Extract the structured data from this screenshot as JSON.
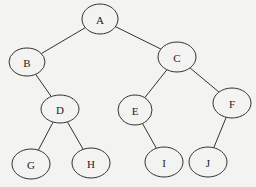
{
  "diagram": {
    "type": "binary-tree",
    "background": "#f3f3f1",
    "stroke_color": "#333333",
    "nodes": [
      {
        "id": "A",
        "label": "A",
        "cx": 100,
        "cy": 19,
        "rx": 18,
        "ry": 15
      },
      {
        "id": "B",
        "label": "B",
        "cx": 27,
        "cy": 62,
        "rx": 18,
        "ry": 14
      },
      {
        "id": "C",
        "label": "C",
        "cx": 177,
        "cy": 57,
        "rx": 19,
        "ry": 15
      },
      {
        "id": "D",
        "label": "D",
        "cx": 60,
        "cy": 109,
        "rx": 19,
        "ry": 14
      },
      {
        "id": "E",
        "label": "E",
        "cx": 135,
        "cy": 110,
        "rx": 17,
        "ry": 15
      },
      {
        "id": "F",
        "label": "F",
        "cx": 232,
        "cy": 103,
        "rx": 19,
        "ry": 15
      },
      {
        "id": "G",
        "label": "G",
        "cx": 31,
        "cy": 164,
        "rx": 19,
        "ry": 15
      },
      {
        "id": "H",
        "label": "H",
        "cx": 91,
        "cy": 163,
        "rx": 19,
        "ry": 15
      },
      {
        "id": "I",
        "label": "I",
        "cx": 164,
        "cy": 162,
        "rx": 19,
        "ry": 15
      },
      {
        "id": "J",
        "label": "J",
        "cx": 208,
        "cy": 162,
        "rx": 19,
        "ry": 15
      }
    ],
    "edges": [
      {
        "from": "A",
        "to": "B"
      },
      {
        "from": "A",
        "to": "C"
      },
      {
        "from": "B",
        "to": "D"
      },
      {
        "from": "C",
        "to": "E"
      },
      {
        "from": "C",
        "to": "F"
      },
      {
        "from": "D",
        "to": "G"
      },
      {
        "from": "D",
        "to": "H"
      },
      {
        "from": "E",
        "to": "I"
      },
      {
        "from": "F",
        "to": "J"
      }
    ]
  }
}
